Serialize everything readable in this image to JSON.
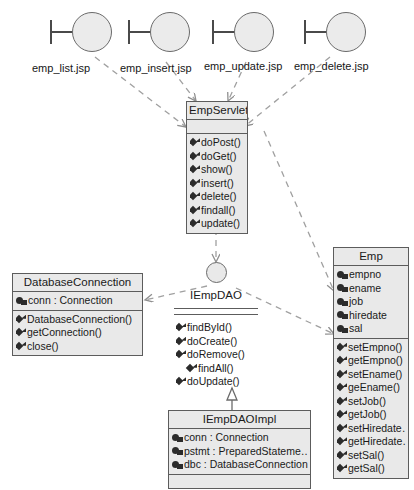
{
  "diagram": {
    "colors": {
      "box_fill": "#e9e9e9",
      "box_border": "#5c5c5c",
      "edge": "#9a9a9a",
      "text": "#161616"
    }
  },
  "jsp_pages": [
    {
      "label": "emp_list.jsp",
      "icon": "provided-interface-lollipop-icon"
    },
    {
      "label": "emp_insert.jsp",
      "icon": "provided-interface-lollipop-icon"
    },
    {
      "label": "emp_update.jsp",
      "icon": "provided-interface-lollipop-icon"
    },
    {
      "label": "emp_delete.jsp",
      "icon": "provided-interface-lollipop-icon"
    }
  ],
  "classes": {
    "emp_servlet": {
      "name": "EmpServlet",
      "attributes": [],
      "methods": [
        "doPost()",
        "doGet()",
        "show()",
        "insert()",
        "delete()",
        "findall()",
        "update()"
      ]
    },
    "database_connection": {
      "name": "DatabaseConnection",
      "attributes": [
        "conn : Connection"
      ],
      "methods": [
        "DatabaseConnection()",
        "getConnection()",
        "close()"
      ]
    },
    "emp": {
      "name": "Emp",
      "attributes": [
        "empno",
        "ename",
        "job",
        "hiredate",
        "sal"
      ],
      "methods": [
        "setEmpno()",
        "getEmpno()",
        "setEname()",
        "geEname()",
        "setJob()",
        "getJob()",
        "setHiredate…",
        "getHiredate…",
        "setSal()",
        "getSal()"
      ]
    },
    "iempdao_impl": {
      "name": "IEmpDAOImpl",
      "attributes": [
        "conn : Connection",
        "pstmt : PreparedStateme…",
        "dbc : DatabaseConnection"
      ],
      "methods": []
    }
  },
  "interfaces": {
    "iempdao": {
      "name": "IEmpDAO",
      "methods": [
        "findById()",
        "doCreate()",
        "doRemove()",
        "findAll()",
        "doUpdate()"
      ]
    }
  }
}
